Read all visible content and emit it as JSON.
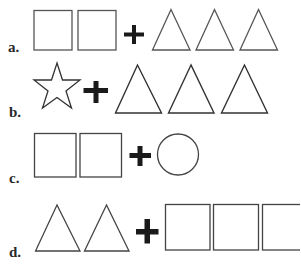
{
  "options": [
    {
      "letter": "a.",
      "left": [
        "square",
        "square"
      ],
      "operator": "+",
      "right": [
        "triangle",
        "triangle",
        "triangle"
      ]
    },
    {
      "letter": "b.",
      "left": [
        "star"
      ],
      "operator": "+",
      "right": [
        "triangle",
        "triangle",
        "triangle"
      ]
    },
    {
      "letter": "c.",
      "left": [
        "square",
        "square"
      ],
      "operator": "+",
      "right": [
        "circle"
      ]
    },
    {
      "letter": "d.",
      "left": [
        "triangle",
        "triangle"
      ],
      "operator": "+",
      "right": [
        "square",
        "square",
        "square"
      ]
    }
  ],
  "colors": {
    "stroke": "#4a4a4a",
    "plus": "#1a1a1a",
    "label": "#2a2a2a",
    "background": "#ffffff"
  }
}
